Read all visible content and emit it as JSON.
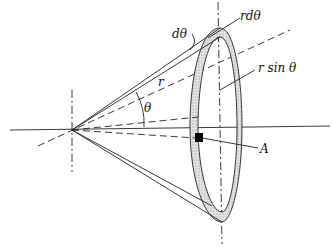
{
  "diagram": {
    "type": "geometry",
    "labels": {
      "d_theta": "dθ",
      "r_d_theta": "rdθ",
      "r": "r",
      "theta": "θ",
      "r_sin_theta": "r sin θ",
      "A": "A"
    },
    "colors": {
      "line": "#222222",
      "ring_fill": "#cfcfcf",
      "area_element": "#000000",
      "background": "#ffffff"
    }
  }
}
